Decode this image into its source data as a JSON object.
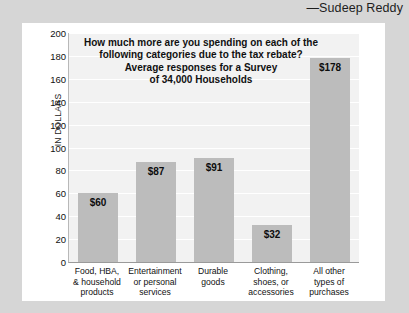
{
  "attribution": "—Sudeep Reddy",
  "chart_data": {
    "type": "bar",
    "title_lines": [
      "How much more are you spending on each of the",
      "following categories due to the tax rebate?",
      "Average responses for a Survey",
      "of 34,000 Households"
    ],
    "xlabel": "",
    "ylabel": "IN DOLLARS",
    "ylim": [
      0,
      200
    ],
    "ytick_step": 20,
    "yticks": [
      "200",
      "180",
      "160",
      "140",
      "120",
      "100",
      "80",
      "60",
      "40",
      "20",
      "0"
    ],
    "grid": true,
    "legend": "none",
    "categories": [
      "Food, HBA, & household products",
      "Entertainment or personal services",
      "Durable goods",
      "Clothing, shoes, or accessories",
      "All other types of purchases"
    ],
    "category_lines": [
      [
        "Food, HBA,",
        "& household",
        "products"
      ],
      [
        "Entertainment",
        "or personal",
        "services"
      ],
      [
        "Durable",
        "goods"
      ],
      [
        "Clothing,",
        "shoes, or",
        "accessories"
      ],
      [
        "All other",
        "types of",
        "purchases"
      ]
    ],
    "values": [
      60,
      87,
      91,
      32,
      178
    ],
    "value_labels": [
      "$60",
      "$87",
      "$91",
      "$32",
      "$178"
    ],
    "bar_color": "#bcbcbc",
    "plot_background": "#f2f2f2",
    "card_background": "#ffffff",
    "page_background": "#d6d6d6"
  }
}
